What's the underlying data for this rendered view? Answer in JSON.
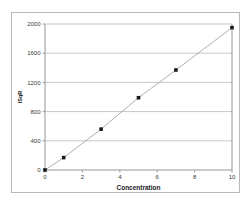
{
  "figure": {
    "background_color": "#ffffff",
    "frame_color": "#b9b9b9",
    "plot_border_color": "#8a8a8a",
    "grid_color": "#b0b0b0",
    "line_color": "#9a9a9a",
    "marker_color": "#1a1a1a",
    "text_color": "#3a3a3a"
  },
  "chart_data": {
    "type": "scatter",
    "title": "",
    "subtitle": "",
    "xlabel": "Concentration",
    "ylabel": "ISqR",
    "x": [
      0,
      1,
      3,
      5,
      7,
      10
    ],
    "values": [
      0,
      170,
      560,
      990,
      1370,
      1950
    ],
    "series": [
      {
        "name": "Standard curve",
        "x": [
          0,
          1,
          3,
          5,
          7,
          10
        ],
        "values": [
          0,
          170,
          560,
          990,
          1370,
          1950
        ],
        "marker": "square",
        "marker_color": "#1a1a1a",
        "line_color": "#9a9a9a"
      }
    ],
    "xlim": [
      0,
      10
    ],
    "ylim": [
      0,
      2000
    ],
    "xticks": [
      0,
      2,
      4,
      6,
      8,
      10
    ],
    "yticks": [
      0,
      400,
      800,
      1200,
      1600,
      2000
    ],
    "xtick_labels": [
      "0",
      "2",
      "4",
      "6",
      "8",
      "10"
    ],
    "ytick_labels": [
      "0",
      "400",
      "800",
      "1200",
      "1600",
      "2000"
    ],
    "grid": true,
    "grid_axis": "y",
    "legend": false,
    "legend_position": "none",
    "annotations": []
  }
}
